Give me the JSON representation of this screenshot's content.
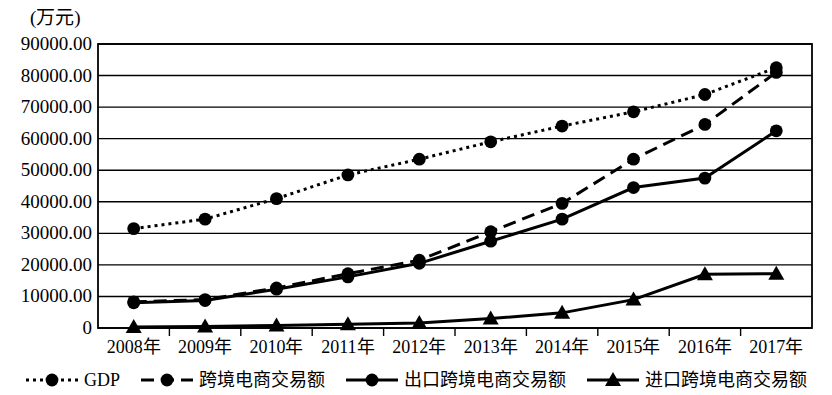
{
  "chart_data": {
    "type": "line",
    "title": "",
    "unit_label": "(万元)",
    "xlabel": "",
    "ylabel": "",
    "categories": [
      "2008年",
      "2009年",
      "2010年",
      "2011年",
      "2012年",
      "2013年",
      "2014年",
      "2015年",
      "2016年",
      "2017年"
    ],
    "ylim": [
      0,
      90000
    ],
    "ytick_step": 10000,
    "ytick_labels": [
      "90000.00",
      "80000.00",
      "70000.00",
      "60000.00",
      "50000.00",
      "40000.00",
      "30000.00",
      "20000.00",
      "10000.00",
      "0"
    ],
    "ytick_values": [
      90000,
      80000,
      70000,
      60000,
      50000,
      40000,
      30000,
      20000,
      10000,
      0
    ],
    "grid": true,
    "legend_position": "bottom",
    "series": [
      {
        "name": "GDP",
        "marker": "circle",
        "line_style": "dotted",
        "color": "#000000",
        "values": [
          31500,
          34500,
          41000,
          48500,
          53500,
          59000,
          64000,
          68500,
          74000,
          82500
        ]
      },
      {
        "name": "跨境电商交易额",
        "marker": "circle",
        "line_style": "dashed",
        "color": "#000000",
        "values": [
          8300,
          9000,
          12700,
          17200,
          21500,
          30500,
          39500,
          53500,
          64500,
          81000
        ]
      },
      {
        "name": "出口跨境电商交易额",
        "marker": "circle",
        "line_style": "solid",
        "color": "#000000",
        "values": [
          8000,
          8700,
          12300,
          16200,
          20500,
          27500,
          34500,
          44500,
          47500,
          62500
        ]
      },
      {
        "name": "进口跨境电商交易额",
        "marker": "triangle",
        "line_style": "solid",
        "color": "#000000",
        "values": [
          300,
          450,
          800,
          1200,
          1600,
          3000,
          4800,
          9000,
          17000,
          17200
        ]
      }
    ]
  }
}
